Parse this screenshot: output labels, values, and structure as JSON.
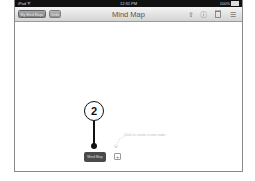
{
  "statusbar": {
    "device": "iPad ᯤ",
    "time": "12:31 PM",
    "battery": "100%"
  },
  "toolbar": {
    "my_mind_maps_label": "My Mind Maps",
    "second_button_label": "Undo",
    "title": "Mind Map",
    "icons": [
      "share-icon",
      "info-icon",
      "trash-icon",
      "list-icon"
    ],
    "icon_glyphs": [
      "⇪",
      "ⓘ",
      "🗑",
      "☰"
    ]
  },
  "canvas": {
    "root_node_label": "Mind Map",
    "add_button_label": "+",
    "hint_text": "Click to create a new node.",
    "callout_number": "2"
  }
}
